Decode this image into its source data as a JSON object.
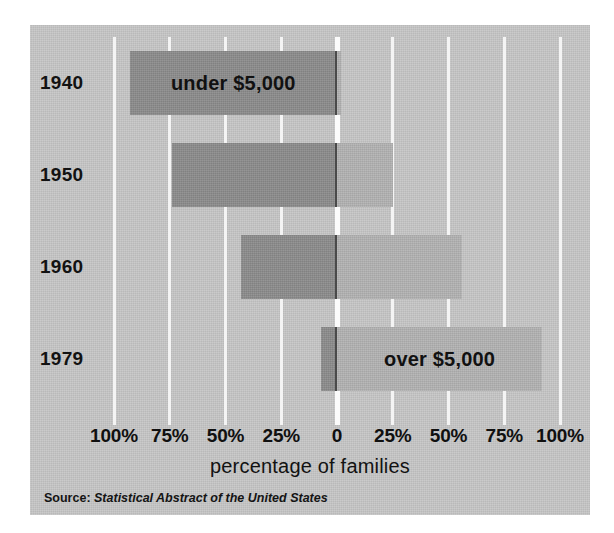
{
  "chart_data": {
    "type": "bar",
    "orientation": "horizontal",
    "subtype": "diverging-stacked",
    "title": "",
    "xlabel": "percentage of families",
    "ylabel": "",
    "categories": [
      "1940",
      "1950",
      "1960",
      "1979"
    ],
    "series": [
      {
        "name": "under $5,000",
        "values": [
          93,
          74,
          43,
          7
        ],
        "color": "#8e8e8e",
        "direction": "left"
      },
      {
        "name": "over $5,000",
        "values": [
          2,
          25,
          56,
          92
        ],
        "color": "#b2b2b2",
        "direction": "right"
      }
    ],
    "xticks": [
      -100,
      -75,
      -50,
      -25,
      0,
      25,
      50,
      75,
      100
    ],
    "xticklabels": [
      "100%",
      "75%",
      "50%",
      "25%",
      "0",
      "25%",
      "50%",
      "75%",
      "100%"
    ],
    "xlim": [
      -100,
      100
    ],
    "grid": true,
    "gridline_color": "#f4f4f4",
    "legend": "in-bar annotations",
    "annotations": [
      {
        "text": "under $5,000",
        "row": "1940",
        "side": "left"
      },
      {
        "text": "over $5,000",
        "row": "1979",
        "side": "right"
      }
    ],
    "source_label": "Source:",
    "source_title": "Statistical Abstract of the United States",
    "panel_background": "#c6c6c6"
  },
  "axis": {
    "title": "percentage of families",
    "ticks": [
      {
        "label": "100%",
        "value": -100
      },
      {
        "label": "75%",
        "value": -75
      },
      {
        "label": "50%",
        "value": -50
      },
      {
        "label": "25%",
        "value": -25
      },
      {
        "label": "0",
        "value": 0
      },
      {
        "label": "25%",
        "value": 25
      },
      {
        "label": "50%",
        "value": 50
      },
      {
        "label": "75%",
        "value": 75
      },
      {
        "label": "100%",
        "value": 100
      }
    ]
  },
  "rows": [
    {
      "year": "1940",
      "under": 93,
      "over": 2,
      "annotation": "under $5,000",
      "annotation_side": "left"
    },
    {
      "year": "1950",
      "under": 74,
      "over": 25,
      "annotation": "",
      "annotation_side": ""
    },
    {
      "year": "1960",
      "under": 43,
      "over": 56,
      "annotation": "",
      "annotation_side": ""
    },
    {
      "year": "1979",
      "under": 7,
      "over": 92,
      "annotation": "over $5,000",
      "annotation_side": "right"
    }
  ],
  "source": {
    "label": "Source:",
    "title": "Statistical Abstract of the United States"
  },
  "colors": {
    "panel": "#c6c6c6",
    "bar_under": "#8e8e8e",
    "bar_over": "#b2b2b2",
    "gridline": "#f4f4f4",
    "text": "#111111"
  }
}
